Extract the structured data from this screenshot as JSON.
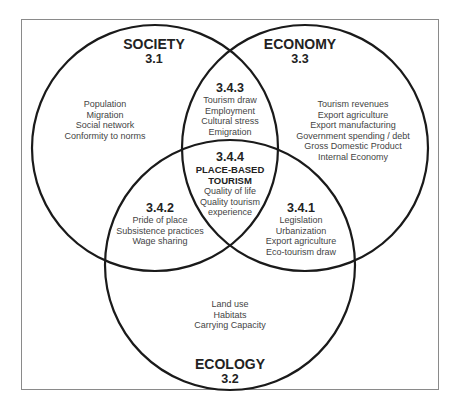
{
  "diagram": {
    "type": "venn",
    "circles": {
      "society": {
        "title": "SOCIETY",
        "number": "3.1",
        "items": [
          "Population",
          "Migration",
          "Social network",
          "Conformity to norms"
        ]
      },
      "economy": {
        "title": "ECONOMY",
        "number": "3.3",
        "items": [
          "Tourism revenues",
          "Export agriculture",
          "Export manufacturing",
          "Government spending /  debt",
          "Gross Domestic Product",
          "Internal Economy"
        ]
      },
      "ecology": {
        "title": "ECOLOGY",
        "number": "3.2",
        "items": [
          "Land use",
          "Habitats",
          "Carrying Capacity"
        ]
      }
    },
    "intersections": {
      "society_economy": {
        "number": "3.4.3",
        "items": [
          "Tourism draw",
          "Employment",
          "Cultural stress",
          "Emigration"
        ]
      },
      "society_ecology": {
        "number": "3.4.2",
        "items": [
          "Pride of place",
          "Subsistence practices",
          "Wage sharing"
        ]
      },
      "economy_ecology": {
        "number": "3.4.1",
        "items": [
          "Legislation",
          "Urbanization",
          "Export agriculture",
          "Eco-tourism draw"
        ]
      },
      "center": {
        "number": "3.4.4",
        "title_line1": "PLACE-BASED",
        "title_line2": "TOURISM",
        "items": [
          "Quality of life",
          "Quality tourism",
          "experience"
        ]
      }
    },
    "colors": {
      "stroke": "#1a1a1a",
      "frame": "#8a8a8a",
      "text": "#444444"
    }
  }
}
